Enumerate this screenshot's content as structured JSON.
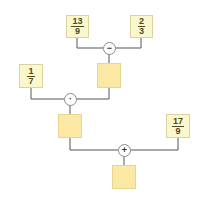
{
  "diagram": {
    "type": "operation-tree",
    "colors": {
      "given_box": "#fbf7cc",
      "blank_box": "#fbe8a4",
      "wire": "#555555",
      "text": "#4a4a1e"
    },
    "given": [
      {
        "id": "a",
        "num": "13",
        "den": "9"
      },
      {
        "id": "b",
        "num": "2",
        "den": "3"
      },
      {
        "id": "c",
        "num": "1",
        "den": "7"
      },
      {
        "id": "d",
        "num": "17",
        "den": "9"
      }
    ],
    "operators": [
      {
        "id": "op1",
        "symbol": "−",
        "name": "subtract",
        "inputs": [
          "a",
          "b"
        ],
        "output": "r1"
      },
      {
        "id": "op2",
        "symbol": "·",
        "name": "multiply",
        "inputs": [
          "c",
          "r1"
        ],
        "output": "r2"
      },
      {
        "id": "op3",
        "symbol": "+",
        "name": "add",
        "inputs": [
          "r2",
          "d"
        ],
        "output": "r3"
      }
    ],
    "results": [
      {
        "id": "r1",
        "value": ""
      },
      {
        "id": "r2",
        "value": ""
      },
      {
        "id": "r3",
        "value": ""
      }
    ]
  }
}
